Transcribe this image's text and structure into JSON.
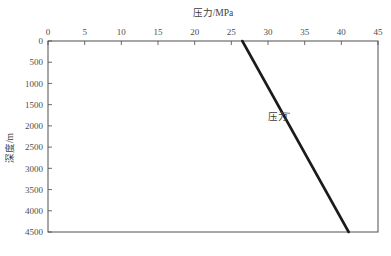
{
  "chart_data": {
    "type": "line",
    "title": "压力/MPa",
    "xlabel": "压力/MPa",
    "ylabel": "深度/m",
    "xlim": [
      0,
      45
    ],
    "ylim": [
      0,
      4500
    ],
    "y_inverted": true,
    "x_axis_position": "top",
    "grid": false,
    "legend": "none",
    "xticks": [
      0,
      5,
      10,
      15,
      20,
      25,
      30,
      35,
      40,
      45
    ],
    "xtick_labels": [
      "0",
      "5",
      "10",
      "15",
      "20",
      "25",
      "30",
      "35",
      "40",
      "45"
    ],
    "yticks": [
      0,
      500,
      1000,
      1500,
      2000,
      2500,
      3000,
      3500,
      4000,
      4500
    ],
    "ytick_labels": [
      "0",
      "500",
      "1000",
      "1500",
      "2000",
      "2500",
      "3000",
      "3500",
      "4000",
      "4500"
    ],
    "series": [
      {
        "name": "压力",
        "color": "#1b1b1b",
        "x": [
          26.5,
          41.0
        ],
        "y": [
          0,
          4500
        ]
      }
    ],
    "annotations": [
      {
        "text": "压力",
        "x": 30.0,
        "y": 1870,
        "point_x": 31.6,
        "point_y": 1680
      }
    ]
  },
  "figure": {
    "background_color": "#ffffff",
    "axis_color": "#4f4f4f"
  }
}
